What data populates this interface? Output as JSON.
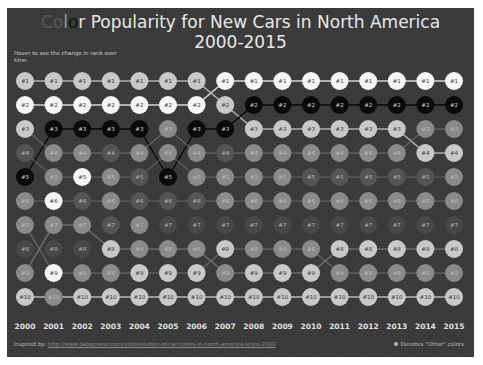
{
  "title": {
    "prefix_faded": "Co",
    "prefix_mid": "l",
    "prefix_dark": "o",
    "prefix_r": "r",
    "line1_rest": " Popularity for New Cars in North America",
    "line2": "2000-2015"
  },
  "hint": "Hover to see the change in rank over time.",
  "footer": {
    "inspired_label": "Inspired by:",
    "link_text": "http://www.datapraxer.com/viz/evolution-of-car-colors-in-north-america-since-2000",
    "legend_text": "Denotes \"Other\" colors"
  },
  "colors": {
    "background": "#3a3a3a",
    "white": "#f5f5f5",
    "silver": "#c8c8c8",
    "black": "#0a0a0a",
    "gray": "#8a8a8a",
    "dim": "#555555",
    "faint": "#484848",
    "lightgray": "#b0b0b0",
    "other": "#6a6a6a"
  },
  "chart_data": {
    "type": "bump",
    "title": "Color Popularity for New Cars in North America 2000-2015",
    "xlabel": "",
    "ylabel": "Rank",
    "years": [
      "2000",
      "2001",
      "2002",
      "2003",
      "2004",
      "2005",
      "2006",
      "2007",
      "2008",
      "2009",
      "2010",
      "2011",
      "2012",
      "2013",
      "2014",
      "2015"
    ],
    "ranks": [
      "#1",
      "#2",
      "#3",
      "#4",
      "#5",
      "#6",
      "#7",
      "#8",
      "#9",
      "#10"
    ],
    "cells": [
      [
        "silver",
        "silver",
        "silver",
        "silver",
        "silver",
        "silver",
        "silver",
        "white",
        "white",
        "white",
        "white",
        "white",
        "white",
        "white",
        "white",
        "white"
      ],
      [
        "white",
        "white",
        "white",
        "white",
        "white",
        "white",
        "white",
        "silver",
        "black",
        "black",
        "black",
        "black",
        "black",
        "black",
        "black",
        "black"
      ],
      [
        "silver",
        "black",
        "black",
        "black",
        "black",
        "gray",
        "black",
        "black",
        "silver",
        "silver",
        "silver",
        "silver",
        "silver",
        "silver",
        "gray",
        "gray"
      ],
      [
        "dim",
        "gray",
        "gray",
        "dim",
        "gray",
        "gray",
        "gray",
        "dim",
        "gray",
        "gray",
        "gray",
        "gray",
        "gray",
        "gray",
        "silver",
        "silver"
      ],
      [
        "black",
        "gray",
        "white",
        "gray",
        "dim",
        "black",
        "gray",
        "gray",
        "gray",
        "gray",
        "dim",
        "dim",
        "dim",
        "dim",
        "dim",
        "gray"
      ],
      [
        "gray",
        "white",
        "dim",
        "gray",
        "dim",
        "dim",
        "dim",
        "gray",
        "gray",
        "gray",
        "gray",
        "gray",
        "gray",
        "gray",
        "gray",
        "gray"
      ],
      [
        "gray",
        "gray",
        "gray",
        "dim",
        "gray",
        "faint",
        "faint",
        "faint",
        "faint",
        "faint",
        "faint",
        "faint",
        "faint",
        "faint",
        "faint",
        "faint"
      ],
      [
        "faint",
        "faint",
        "faint",
        "silver",
        "gray",
        "gray",
        "gray",
        "silver",
        "gray",
        "gray",
        "gray",
        "silver",
        "silver",
        "silver",
        "silver",
        "silver"
      ],
      [
        "gray",
        "white",
        "gray",
        "gray",
        "silver",
        "silver",
        "silver",
        "gray",
        "silver",
        "silver",
        "silver",
        "gray",
        "gray",
        "gray",
        "gray",
        "gray"
      ],
      [
        "silver",
        "gray",
        "silver",
        "silver",
        "silver",
        "silver",
        "silver",
        "silver",
        "silver",
        "silver",
        "silver",
        "silver",
        "silver",
        "silver",
        "silver",
        "silver"
      ]
    ],
    "series_lines": [
      {
        "name": "white",
        "color": "#dcdcdc",
        "ranks": [
          2,
          2,
          2,
          2,
          2,
          2,
          2,
          1,
          1,
          1,
          1,
          1,
          1,
          1,
          1,
          1
        ]
      },
      {
        "name": "silver",
        "color": "#b5b5b5",
        "ranks": [
          1,
          1,
          1,
          1,
          1,
          1,
          1,
          2,
          3,
          3,
          3,
          3,
          3,
          3,
          4,
          4
        ]
      },
      {
        "name": "black",
        "color": "#050505",
        "ranks": [
          5,
          3,
          3,
          3,
          3,
          5,
          3,
          3,
          2,
          2,
          2,
          2,
          2,
          2,
          2,
          2
        ]
      },
      {
        "name": "gray",
        "color": "#8c8c8c",
        "ranks": [
          3,
          4,
          4,
          4,
          4,
          3,
          4,
          4,
          4,
          4,
          4,
          4,
          4,
          4,
          3,
          3
        ]
      },
      {
        "name": "red",
        "color": "#7a7a7a",
        "ranks": [
          4,
          5,
          5,
          5,
          5,
          4,
          5,
          5,
          5,
          5,
          5,
          5,
          5,
          5,
          5,
          5
        ]
      },
      {
        "name": "blue",
        "color": "#7f7f7f",
        "ranks": [
          6,
          6,
          6,
          6,
          6,
          6,
          6,
          6,
          6,
          6,
          6,
          6,
          6,
          6,
          6,
          6
        ]
      },
      {
        "name": "beige",
        "color": "#a5a5a5",
        "ranks": [
          9,
          7,
          7,
          8,
          8,
          8,
          8,
          9,
          9,
          9,
          9,
          8,
          8,
          8,
          8,
          8
        ]
      },
      {
        "name": "green",
        "color": "#8a8a8a",
        "ranks": [
          7,
          9,
          9,
          9,
          9,
          9,
          9,
          8,
          8,
          8,
          8,
          9,
          9,
          9,
          9,
          9
        ]
      },
      {
        "name": "yellow",
        "color": "#c0c0c0",
        "ranks": [
          10,
          10,
          10,
          10,
          10,
          10,
          10,
          10,
          10,
          10,
          10,
          10,
          10,
          10,
          10,
          10
        ]
      }
    ],
    "grid": false,
    "legend_position": "bottom-right"
  }
}
